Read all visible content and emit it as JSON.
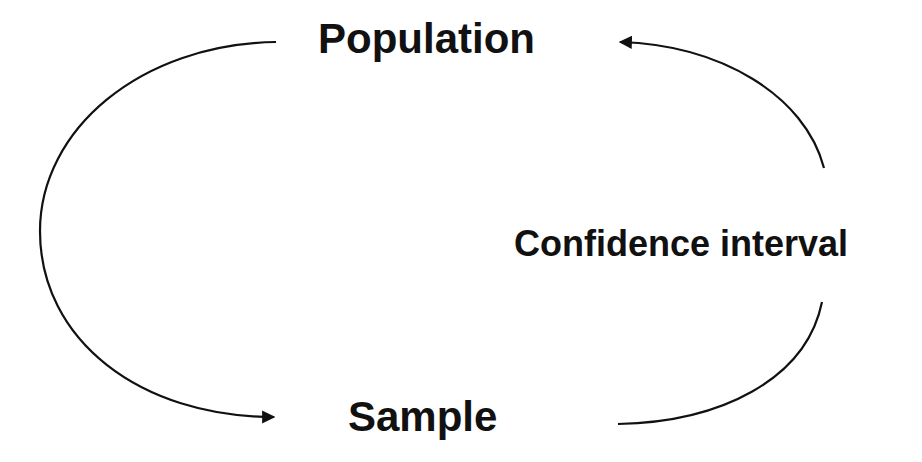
{
  "diagram": {
    "nodes": [
      {
        "id": "population",
        "label": "Population"
      },
      {
        "id": "sample",
        "label": "Sample"
      },
      {
        "id": "confidence_interval",
        "label": "Confidence interval"
      }
    ],
    "edges": [
      {
        "from": "population",
        "to": "sample",
        "style": "curved arrow, left side"
      },
      {
        "from": "sample",
        "to": "confidence_interval",
        "style": "curved line, lower right"
      },
      {
        "from": "confidence_interval",
        "to": "population",
        "style": "curved arrow, upper right"
      }
    ],
    "colors": {
      "stroke": "#111111",
      "background": "#ffffff"
    }
  }
}
